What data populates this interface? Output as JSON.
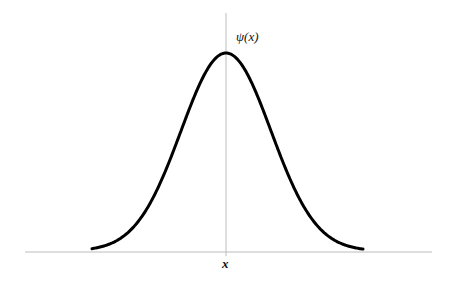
{
  "diagram": {
    "y_axis_label": "ψ(x)",
    "x_axis_label": "x",
    "colors": {
      "curve": "#000000",
      "axis": "#bdbdbd",
      "background": "#ffffff"
    },
    "geometry": {
      "x_axis": {
        "x1": 25,
        "x2": 432,
        "y": 252
      },
      "y_axis": {
        "x": 226,
        "y1": 13,
        "y2": 256
      },
      "curve": {
        "center_x": 226,
        "baseline_y": 252,
        "peak_y": 54,
        "sigma_px": 45,
        "x_start": 92,
        "x_end": 363,
        "stroke_width": 3
      }
    }
  },
  "chart_data": {
    "type": "line",
    "title": "",
    "xlabel": "x",
    "ylabel": "ψ(x)",
    "series": [
      {
        "name": "ψ(x)",
        "x": [
          -3,
          -2.5,
          -2,
          -1.5,
          -1,
          -0.5,
          0,
          0.5,
          1,
          1.5,
          2,
          2.5,
          3
        ],
        "values": [
          0.011,
          0.044,
          0.135,
          0.325,
          0.607,
          0.882,
          1.0,
          0.882,
          0.607,
          0.325,
          0.135,
          0.044,
          0.011
        ]
      }
    ],
    "grid": false,
    "legend": "none"
  }
}
